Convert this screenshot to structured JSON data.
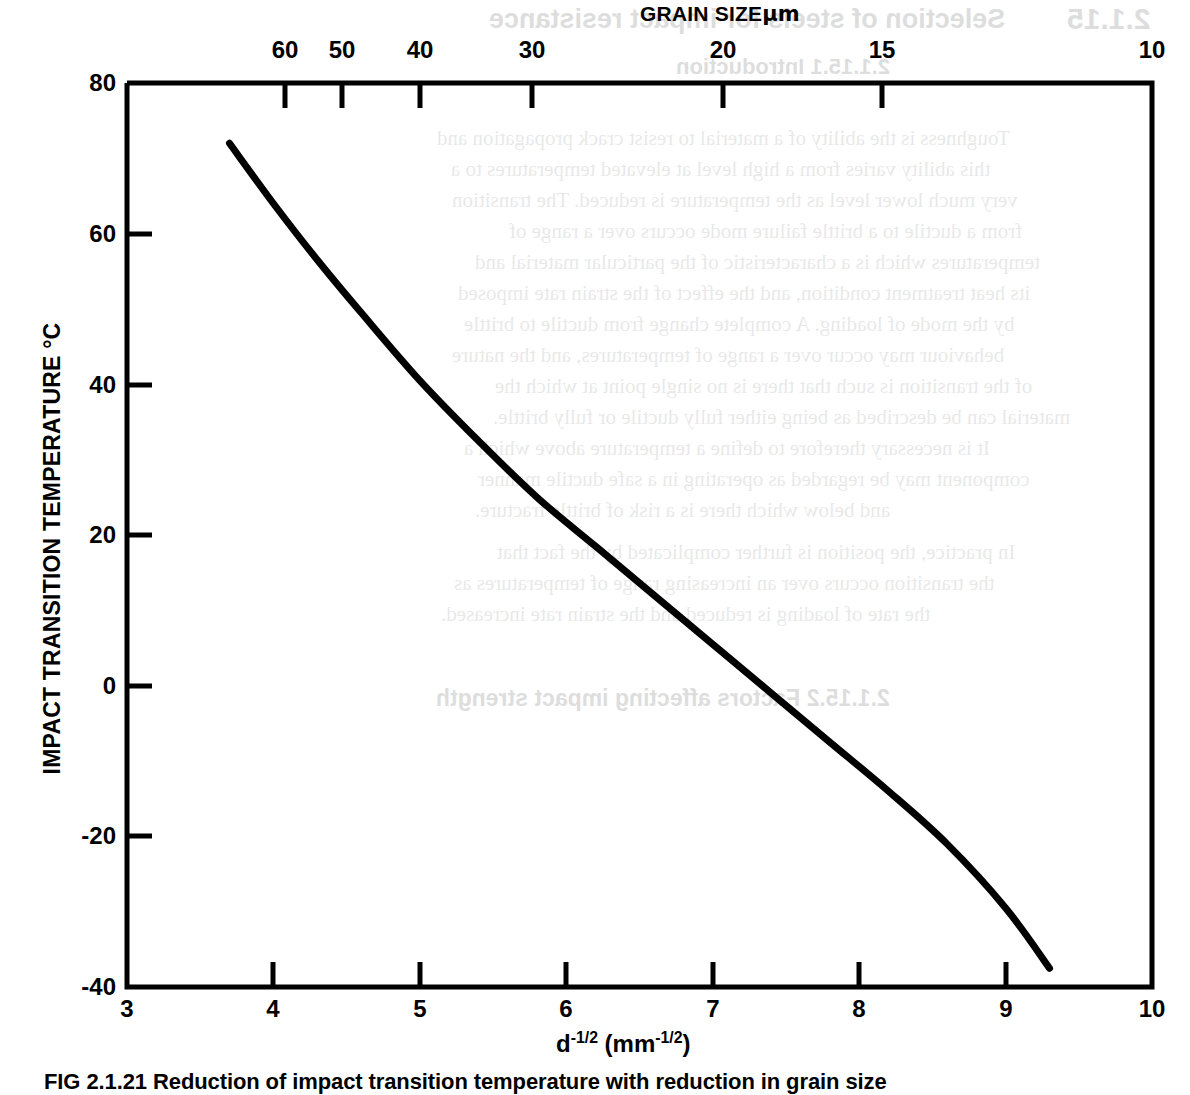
{
  "chart_data": {
    "type": "line",
    "xlabel": "d-1/2 (mm-1/2)",
    "ylabel": "IMPACT TRANSITION TEMPERATURE °C",
    "xlim": [
      3,
      10
    ],
    "ylim": [
      -40,
      80
    ],
    "grid": false,
    "legend": "none",
    "line_color": "#000000",
    "x_ticks": [
      3,
      4,
      5,
      6,
      7,
      8,
      9,
      10
    ],
    "x_tick_labels": [
      "3",
      "4",
      "5",
      "6",
      "7",
      "8",
      "9",
      "10"
    ],
    "y_ticks": [
      80,
      60,
      40,
      20,
      0,
      -20,
      -40
    ],
    "y_tick_labels": [
      "80",
      "60",
      "40",
      "20",
      "0",
      "-20",
      "-40"
    ],
    "secondary_x_axis": {
      "label": "GRAIN SIZE µm",
      "position": "top",
      "tick_labels": [
        "60",
        "50",
        "40",
        "30",
        "20",
        "15",
        "10"
      ],
      "tick_values_um": [
        60,
        50,
        40,
        30,
        20,
        15,
        10
      ],
      "tick_positions_d": [
        4.08,
        4.47,
        5.0,
        5.77,
        7.07,
        8.16,
        10.0
      ]
    },
    "series": [
      {
        "name": "impact transition temperature",
        "x": [
          3.7,
          4.0,
          4.3,
          4.6,
          5.0,
          5.4,
          5.8,
          6.2,
          6.6,
          7.0,
          7.4,
          7.8,
          8.2,
          8.6,
          9.0,
          9.3
        ],
        "y": [
          72.0,
          64.0,
          56.5,
          49.5,
          40.5,
          32.5,
          25.0,
          18.5,
          12.0,
          5.5,
          -1.0,
          -7.5,
          -14.0,
          -21.0,
          -29.5,
          -37.5
        ]
      }
    ]
  },
  "axes": {
    "top_title": "GRAIN SIZE",
    "top_title_unit": "µm",
    "y_title": "IMPACT TRANSITION TEMPERATURE °C",
    "x_title_base": "d",
    "x_title_exp1": "-1/2",
    "x_title_mid": " (mm",
    "x_title_exp2": "-1/2",
    "x_title_end": ")"
  },
  "caption": {
    "text": "FIG 2.1.21 Reduction of impact transition temperature with reduction in grain size"
  },
  "bleed_through": {
    "heading_number": "2.1.15",
    "heading_title": "Selection of steels for impact resistance",
    "subheading": "2.1.15.1  Introduction",
    "section_heading": "2.1.15.2  Factors affecting impact strength",
    "lines": [
      "Toughness is the ability of a material to resist crack propagation and",
      "this ability varies from a high level at elevated temperatures to a",
      "very much lower level as the temperature is reduced. The transition",
      "from a ductile to a brittle failure mode occurs over a range of",
      "temperatures which is a characteristic of the particular material and",
      "its heat treatment condition, and the effect of the strain rate imposed",
      "by the mode of loading. A complete change from ductile to brittle",
      "behaviour may occur over a range of temperatures, and the nature",
      "of the transition is such that there is no single point at which the",
      "material can be described as being either fully ductile or fully brittle.",
      "It is necessary therefore to define a temperature above which a",
      "component may be regarded as operating in a safe ductile manner",
      "and below which there is a risk of brittle fracture.",
      "In practice, the position is further complicated by the fact that",
      "the transition occurs over an increasing range of temperatures as",
      "the rate of loading is reduced and the strain rate increased."
    ]
  }
}
